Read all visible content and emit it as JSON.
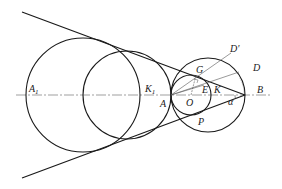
{
  "diagram": {
    "points": {
      "A1": {
        "label": "A",
        "sub": "1"
      },
      "K1": {
        "label": "K",
        "sub": "1"
      },
      "A": {
        "label": "A"
      },
      "O": {
        "label": "O"
      },
      "E": {
        "label": "E"
      },
      "K": {
        "label": "K"
      },
      "G": {
        "label": "G"
      },
      "D_prime": {
        "label": "D'"
      },
      "D": {
        "label": "D"
      },
      "B": {
        "label": "B"
      },
      "P": {
        "label": "P"
      },
      "alpha": {
        "label": "α"
      }
    },
    "colors": {
      "stroke": "#1a1a1a",
      "thin": "#555555",
      "background": "#ffffff"
    }
  }
}
